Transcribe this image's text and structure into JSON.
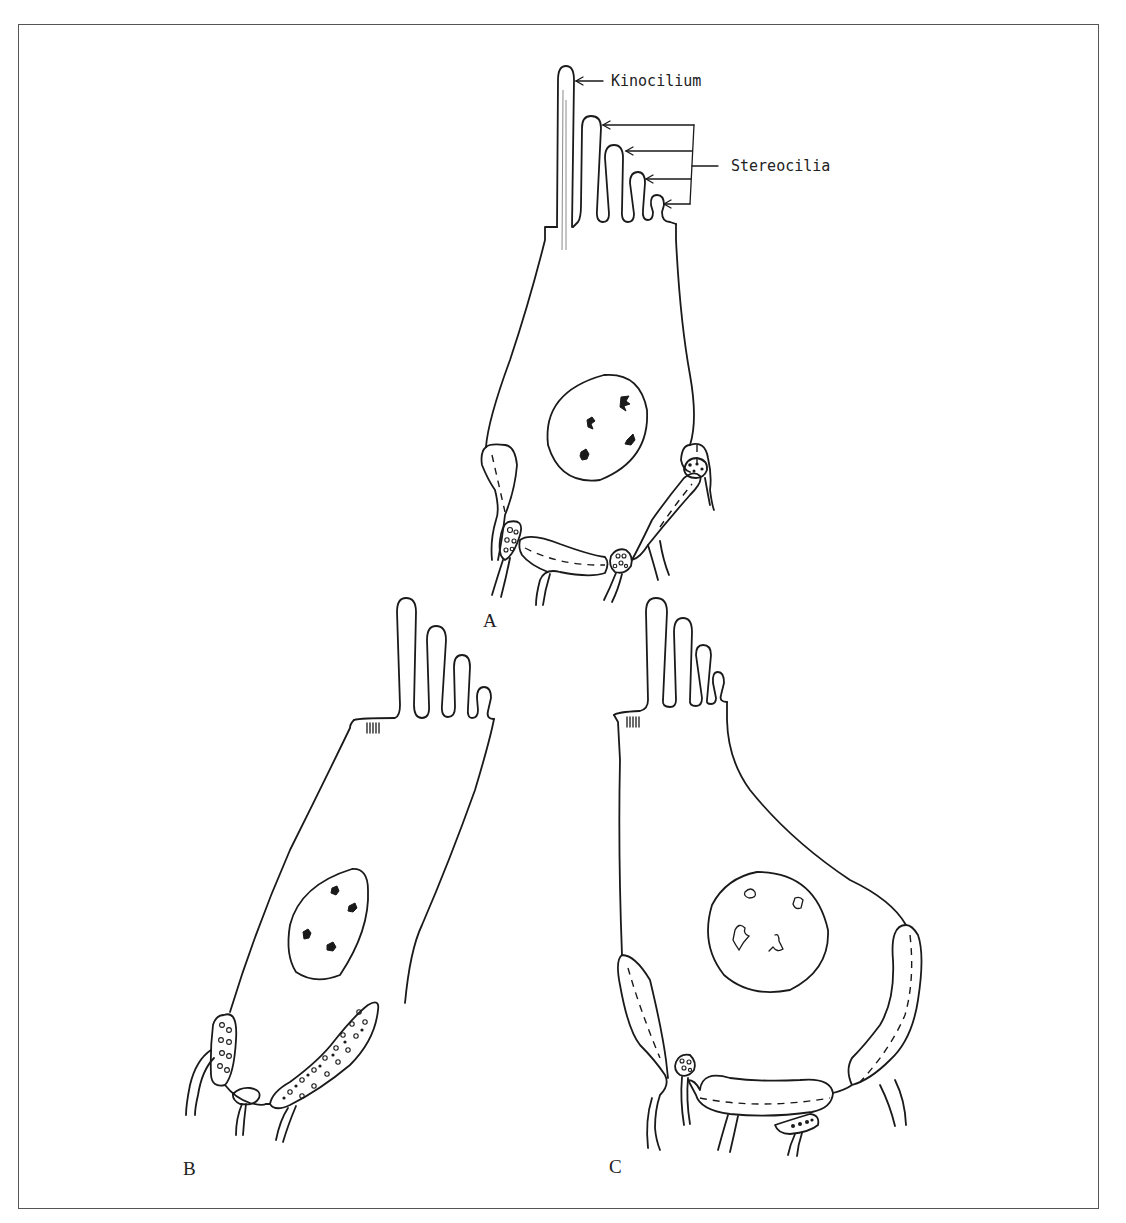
{
  "figure": {
    "colors": {
      "line": "#1a1a1a",
      "border": "#555555",
      "background": "#ffffff"
    },
    "annotations": {
      "kinocilium": "Kinocilium",
      "stereocilia": "Stereocilia"
    },
    "panels": [
      {
        "id": "A",
        "label": "A"
      },
      {
        "id": "B",
        "label": "B"
      },
      {
        "id": "C",
        "label": "C"
      }
    ]
  }
}
